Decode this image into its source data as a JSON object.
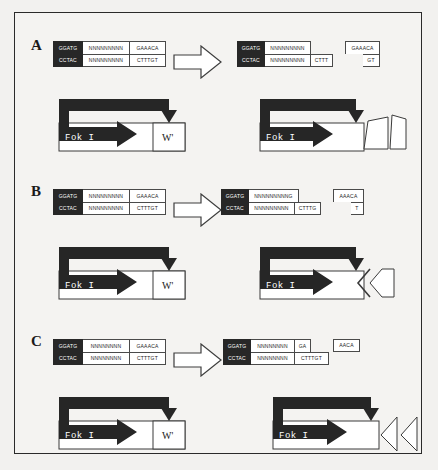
{
  "figure": {
    "background_color": "#f2f1ef",
    "border_color": "#2a2a2a",
    "dark_box_color": "#272727",
    "line_color": "#4a4a4a"
  },
  "panels": [
    {
      "letter": "A",
      "before": {
        "top": [
          "GGATG",
          "NNNNNNNNN",
          "GAAACA"
        ],
        "bottom": [
          "CCTAC",
          "NNNNNNNNN",
          "CTTTGT"
        ]
      },
      "after": {
        "left_top": [
          "GGATG",
          "NNNNNNNNN"
        ],
        "left_bottom": [
          "CCTAC",
          "NNNNNNNNN",
          "CTTT"
        ],
        "right_top": [
          "GAAACA"
        ],
        "right_bottom": [
          "GT"
        ]
      },
      "enzyme_before": {
        "label": "Fok I",
        "domain_label": "W'"
      },
      "enzyme_after": {
        "label": "Fok I",
        "domain_state": "detached-quadrilateral"
      }
    },
    {
      "letter": "B",
      "before": {
        "top": [
          "GGATG",
          "NNNNNNNNN",
          "GAAACA"
        ],
        "bottom": [
          "CCTAC",
          "NNNNNNNNN",
          "CTTTGT"
        ]
      },
      "after": {
        "left_top": [
          "GGATG",
          "NNNNNNNNNG"
        ],
        "left_bottom": [
          "CCTAC",
          "NNNNNNNNN",
          "CTTTG"
        ],
        "right_top": [
          "AAACA"
        ],
        "right_bottom": [
          "T"
        ]
      },
      "enzyme_before": {
        "label": "Fok I",
        "domain_label": "W'"
      },
      "enzyme_after": {
        "label": "Fok I",
        "domain_state": "double-chevron"
      }
    },
    {
      "letter": "C",
      "before": {
        "top": [
          "GGATG",
          "NNNNNNNN",
          "GAAACA"
        ],
        "bottom": [
          "CCTAC",
          "NNNNNNNN",
          "CTTTGT"
        ]
      },
      "after": {
        "left_top": [
          "GGATG",
          "NNNNNNNN",
          "GA"
        ],
        "left_bottom": [
          "CCTAC",
          "NNNNNNNN",
          "CTTTGT"
        ],
        "right_top": [
          "AACA"
        ],
        "right_bottom": ""
      },
      "enzyme_before": {
        "label": "Fok I",
        "domain_label": "W'"
      },
      "enzyme_after": {
        "label": "Fok I",
        "domain_state": "split-chevrons"
      }
    }
  ],
  "icons": {
    "transition_arrow": "right-block-arrow",
    "recognition_arrow": "right-arrow-white"
  }
}
